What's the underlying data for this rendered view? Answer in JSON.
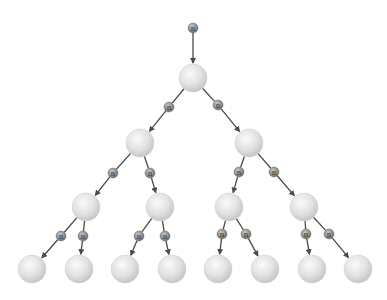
{
  "diagram": {
    "type": "chain-reaction-tree",
    "neutron_label": "n",
    "colors": {
      "arrow": "#4a4a4a",
      "nucleus": "#e4e4e4",
      "neutron": "#8a8a8a"
    },
    "nuclei": [
      {
        "id": "root",
        "x": 193,
        "y": 78
      },
      {
        "id": "l1a",
        "x": 140,
        "y": 143
      },
      {
        "id": "l1b",
        "x": 249,
        "y": 143
      },
      {
        "id": "l2a",
        "x": 86,
        "y": 207
      },
      {
        "id": "l2b",
        "x": 160,
        "y": 207
      },
      {
        "id": "l2c",
        "x": 229,
        "y": 207
      },
      {
        "id": "l2d",
        "x": 304,
        "y": 207
      },
      {
        "id": "l3a",
        "x": 32,
        "y": 269
      },
      {
        "id": "l3b",
        "x": 79,
        "y": 269
      },
      {
        "id": "l3c",
        "x": 125,
        "y": 269
      },
      {
        "id": "l3d",
        "x": 172,
        "y": 269
      },
      {
        "id": "l3e",
        "x": 218,
        "y": 269
      },
      {
        "id": "l3f",
        "x": 265,
        "y": 269
      },
      {
        "id": "l3g",
        "x": 312,
        "y": 269
      },
      {
        "id": "l3h",
        "x": 358,
        "y": 269
      }
    ],
    "neutrons": [
      {
        "x": 193,
        "y": 28,
        "from": null,
        "to": "root",
        "fx": 193,
        "fy": 22
      },
      {
        "x": 169,
        "y": 107,
        "from": "root",
        "to": "l1a"
      },
      {
        "x": 218,
        "y": 105,
        "from": "root",
        "to": "l1b"
      },
      {
        "x": 113,
        "y": 173,
        "from": "l1a",
        "to": "l2a"
      },
      {
        "x": 150,
        "y": 173,
        "from": "l1a",
        "to": "l2b"
      },
      {
        "x": 239,
        "y": 172,
        "from": "l1b",
        "to": "l2c"
      },
      {
        "x": 274,
        "y": 172,
        "from": "l1b",
        "to": "l2d"
      },
      {
        "x": 61,
        "y": 236,
        "from": "l2a",
        "to": "l3a"
      },
      {
        "x": 83,
        "y": 236,
        "from": "l2a",
        "to": "l3b"
      },
      {
        "x": 139,
        "y": 236,
        "from": "l2b",
        "to": "l3c"
      },
      {
        "x": 165,
        "y": 236,
        "from": "l2b",
        "to": "l3d"
      },
      {
        "x": 222,
        "y": 234,
        "from": "l2c",
        "to": "l3e"
      },
      {
        "x": 246,
        "y": 234,
        "from": "l2c",
        "to": "l3f"
      },
      {
        "x": 306,
        "y": 234,
        "from": "l2d",
        "to": "l3g"
      },
      {
        "x": 329,
        "y": 234,
        "from": "l2d",
        "to": "l3h"
      }
    ]
  }
}
